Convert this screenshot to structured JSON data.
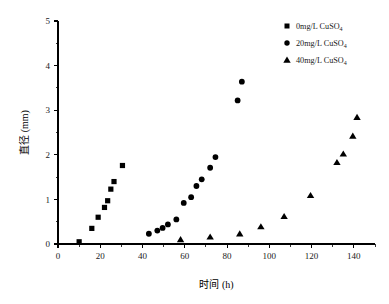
{
  "chart_data": {
    "type": "scatter",
    "title": "",
    "xlabel": "时间 (h)",
    "ylabel": "直径 (mm)",
    "xlim": [
      0,
      150
    ],
    "ylim": [
      0,
      5
    ],
    "xticks": [
      0,
      20,
      40,
      60,
      80,
      100,
      120,
      140
    ],
    "yticks": [
      0,
      1,
      2,
      3,
      4,
      5
    ],
    "xtick_labels": [
      "0",
      "20",
      "40",
      "60",
      "80",
      "100",
      "120",
      "140"
    ],
    "ytick_labels": [
      "0",
      "1",
      "2",
      "3",
      "4",
      "5"
    ],
    "x_minor_step": 10,
    "y_minor_step": 0.5,
    "grid": false,
    "legend_position": "top-right",
    "series": [
      {
        "name": "0mg/L CuSO4",
        "legend_label_main": "0mg/L CuSO",
        "legend_label_sub": "4",
        "marker": "square",
        "color": "#000000",
        "points": [
          [
            10.0,
            0.05
          ],
          [
            16.0,
            0.35
          ],
          [
            19.0,
            0.6
          ],
          [
            22.0,
            0.82
          ],
          [
            23.5,
            0.97
          ],
          [
            25.0,
            1.23
          ],
          [
            26.5,
            1.4
          ],
          [
            30.5,
            1.76
          ]
        ]
      },
      {
        "name": "20mg/L CuSO4",
        "legend_label_main": "20mg/L CuSO",
        "legend_label_sub": "4",
        "marker": "circle",
        "color": "#000000",
        "points": [
          [
            43.0,
            0.23
          ],
          [
            47.0,
            0.3
          ],
          [
            49.5,
            0.36
          ],
          [
            52.0,
            0.44
          ],
          [
            56.0,
            0.55
          ],
          [
            59.5,
            0.92
          ],
          [
            63.0,
            1.05
          ],
          [
            65.5,
            1.3
          ],
          [
            68.0,
            1.45
          ],
          [
            72.0,
            1.71
          ],
          [
            74.5,
            1.95
          ],
          [
            85.0,
            3.22
          ],
          [
            87.0,
            3.64
          ]
        ]
      },
      {
        "name": "40mg/L CuSO4",
        "legend_label_main": "40mg/L CuSO",
        "legend_label_sub": "4",
        "marker": "triangle",
        "color": "#000000",
        "points": [
          [
            58.0,
            0.1
          ],
          [
            72.0,
            0.16
          ],
          [
            86.0,
            0.23
          ],
          [
            96.0,
            0.39
          ],
          [
            107.0,
            0.62
          ],
          [
            119.5,
            1.09
          ],
          [
            132.0,
            1.83
          ],
          [
            135.0,
            2.02
          ],
          [
            139.5,
            2.42
          ],
          [
            141.5,
            2.84
          ]
        ]
      }
    ]
  },
  "legend": {
    "entries": [
      {
        "label_main": "0mg/L CuSO",
        "label_sub": "4",
        "marker": "square"
      },
      {
        "label_main": "20mg/L CuSO",
        "label_sub": "4",
        "marker": "circle"
      },
      {
        "label_main": "40mg/L CuSO",
        "label_sub": "4",
        "marker": "triangle"
      }
    ]
  },
  "axes": {
    "x_title": "时间 (h)",
    "y_title": "直径 (mm)"
  }
}
